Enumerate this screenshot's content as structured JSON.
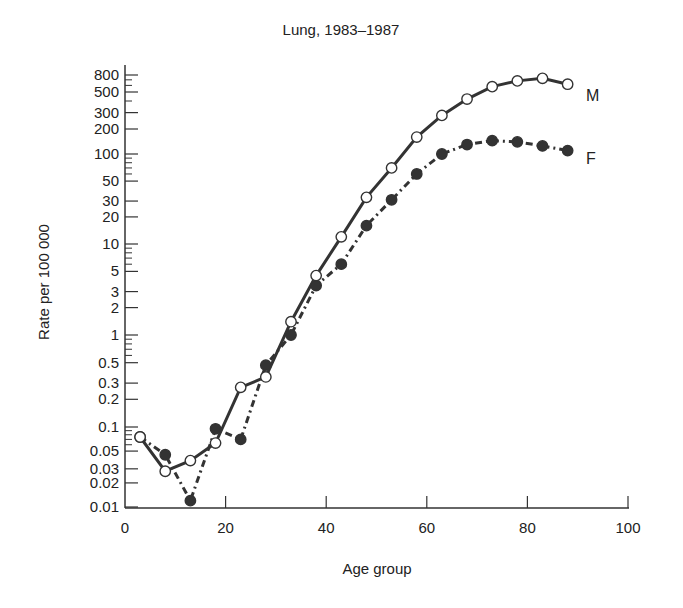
{
  "chart_data": {
    "type": "line",
    "title": "Lung, 1983–1987",
    "xlabel": "Age group",
    "ylabel": "Rate per 100 000",
    "xlim": [
      0,
      100
    ],
    "ylim": [
      0.01,
      800
    ],
    "yscale": "log",
    "grid": false,
    "x_ticks": [
      0,
      20,
      40,
      60,
      80,
      100
    ],
    "x_tick_labels": [
      "0",
      "20",
      "40",
      "60",
      "80",
      "100"
    ],
    "y_tick_labels": [
      "800",
      "500",
      "300",
      "200",
      "100",
      "50",
      "30",
      "20",
      "10",
      "5",
      "3",
      "2",
      "1",
      "0.5",
      "0.3",
      "0.2",
      "0.1",
      "0.05",
      "0.03",
      "0.02",
      "0.01"
    ],
    "y_ticks": [
      800,
      500,
      300,
      200,
      100,
      50,
      30,
      20,
      10,
      5,
      3,
      2,
      1,
      0.5,
      0.3,
      0.2,
      0.1,
      0.05,
      0.03,
      0.02,
      0.01
    ],
    "legend_position": "inline-right",
    "x": [
      3,
      8,
      13,
      18,
      23,
      28,
      33,
      38,
      43,
      48,
      53,
      58,
      63,
      68,
      73,
      78,
      83,
      88
    ],
    "series": [
      {
        "name": "M",
        "marker": "open-circle",
        "line": "solid",
        "values": [
          0.075,
          0.028,
          0.038,
          0.063,
          0.27,
          0.35,
          1.4,
          4.5,
          12,
          33,
          70,
          160,
          280,
          420,
          580,
          680,
          730,
          620
        ]
      },
      {
        "name": "F",
        "marker": "filled-circle",
        "line": "dash-dot",
        "values": [
          0.075,
          0.045,
          0.012,
          0.095,
          0.07,
          0.47,
          1.0,
          3.5,
          6,
          16,
          31,
          60,
          100,
          130,
          145,
          140,
          125,
          110
        ]
      }
    ]
  },
  "colors": {
    "ink": "#333333",
    "marker_fill": "#333333",
    "background": "#ffffff"
  }
}
